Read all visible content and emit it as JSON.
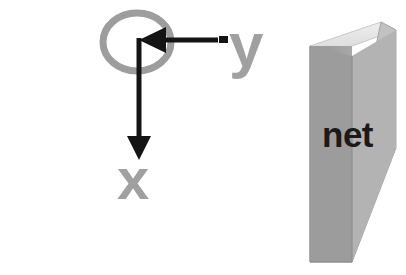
{
  "figure": {
    "background_color": "#ffffff",
    "width": 406,
    "height": 275
  },
  "axes": {
    "origin_marker": {
      "shape": "ellipse-outline",
      "color": "#9d9d9d",
      "stroke_width": 6,
      "cx": 137,
      "cy": 42,
      "rx": 37,
      "ry": 31
    },
    "x_axis": {
      "label": "x",
      "label_color": "#a0a0a0",
      "arrow_color": "#141414",
      "direction": "down",
      "from": [
        139,
        38
      ],
      "to": [
        139,
        158
      ]
    },
    "y_axis": {
      "label": "y",
      "label_color": "#a0a0a0",
      "arrow_color": "#141414",
      "direction": "left",
      "from": [
        218,
        40
      ],
      "to": [
        140,
        40
      ]
    }
  },
  "net": {
    "label": "net",
    "label_color": "#1a1a1a",
    "front_face_color": "#9c9c9c",
    "top_face_color": "#e2e2e2",
    "side_face_color": "#b6b6b6",
    "edge_color": "#8a8a8a"
  }
}
